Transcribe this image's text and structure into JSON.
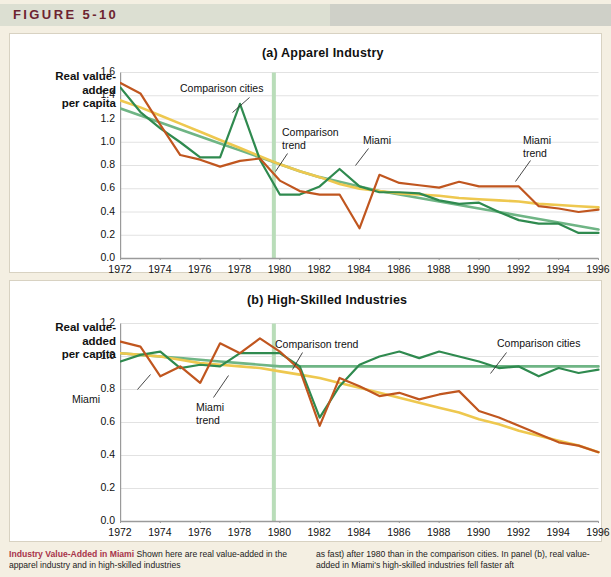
{
  "figure": {
    "label": "FIGURE 5-10"
  },
  "caption": {
    "heading": "Industry Value-Added in Miami",
    "left_text": " Shown here are real value-added in the apparel industry and in high-skilled industries",
    "right_text": "as fast) after 1980 than in the comparison cities. In panel (b), real value-added in Miami's high-skilled industries fell faster aft"
  },
  "colors": {
    "miami": "#c0561f",
    "comparison_cities": "#2f8a4f",
    "miami_trend": "#eec84f",
    "comparison_trend": "#6fb585",
    "marker_line": "#b9ddb9",
    "grid": "#e2e2e2",
    "axis": "#9a9a9a",
    "panel_bg": "#ffffff",
    "page_bg": "#f4efe2",
    "header_bar": "#dcdfd2",
    "header_text": "#6d2430",
    "caption_heading": "#a8344a"
  },
  "chart_data": [
    {
      "type": "line",
      "panel": "a",
      "title": "(a)  Apparel Industry",
      "ylabel": "Real value-\nadded\nper capita",
      "xlabel": "",
      "ylim": [
        0.0,
        1.6
      ],
      "yticks": [
        "0.0",
        "0.2",
        "0.4",
        "0.6",
        "0.8",
        "1.0",
        "1.2",
        "1.4",
        "1.6"
      ],
      "xlim": [
        1972,
        1996
      ],
      "xticks": [
        "1972",
        "1974",
        "1976",
        "1978",
        "1980",
        "1982",
        "1984",
        "1986",
        "1988",
        "1990",
        "1992",
        "1994",
        "1996"
      ],
      "grid": true,
      "legend": "annotations",
      "marker_year": 1979.7,
      "annotations": [
        {
          "text": "Comparison cities",
          "name": "comparison-cities-label"
        },
        {
          "text": "Comparison\ntrend",
          "name": "comparison-trend-label"
        },
        {
          "text": "Miami",
          "name": "miami-label"
        },
        {
          "text": "Miami\ntrend",
          "name": "miami-trend-label"
        }
      ],
      "x": [
        1972,
        1973,
        1974,
        1975,
        1976,
        1977,
        1978,
        1979,
        1980,
        1981,
        1982,
        1983,
        1984,
        1985,
        1986,
        1987,
        1988,
        1989,
        1990,
        1991,
        1992,
        1993,
        1994,
        1995,
        1996
      ],
      "series": [
        {
          "name": "Miami",
          "color": "#c0561f",
          "values": [
            1.51,
            1.42,
            1.15,
            0.89,
            0.85,
            0.79,
            0.84,
            0.86,
            0.67,
            0.58,
            0.55,
            0.55,
            0.26,
            0.72,
            0.65,
            0.63,
            0.61,
            0.66,
            0.62,
            0.62,
            0.62,
            0.45,
            0.43,
            0.4,
            0.42,
            0.36,
            0.35
          ]
        },
        {
          "name": "Comparison cities",
          "color": "#2f8a4f",
          "values": [
            1.47,
            1.26,
            1.12,
            1.0,
            0.87,
            0.87,
            1.33,
            0.85,
            0.55,
            0.55,
            0.62,
            0.77,
            0.62,
            0.57,
            0.57,
            0.56,
            0.5,
            0.47,
            0.48,
            0.4,
            0.33,
            0.3,
            0.3,
            0.22,
            0.22,
            0.3,
            0.33
          ]
        },
        {
          "name": "Miami trend",
          "color": "#eec84f",
          "values": [
            1.36,
            1.3,
            1.23,
            1.16,
            1.09,
            1.02,
            0.95,
            0.88,
            0.81,
            0.75,
            0.7,
            0.64,
            0.6,
            0.58,
            0.56,
            0.55,
            0.54,
            0.52,
            0.51,
            0.5,
            0.49,
            0.47,
            0.46,
            0.45,
            0.44,
            0.43,
            0.42
          ]
        },
        {
          "name": "Comparison trend",
          "color": "#6fb585",
          "values": [
            1.29,
            1.23,
            1.17,
            1.11,
            1.05,
            0.99,
            0.93,
            0.87,
            0.81,
            0.75,
            0.7,
            0.66,
            0.62,
            0.58,
            0.55,
            0.52,
            0.49,
            0.46,
            0.43,
            0.4,
            0.37,
            0.34,
            0.31,
            0.28,
            0.25,
            0.22,
            0.2
          ]
        }
      ]
    },
    {
      "type": "line",
      "panel": "b",
      "title": "(b)  High-Skilled Industries",
      "ylabel": "Real value-\nadded\nper capita",
      "xlabel": "",
      "ylim": [
        0.0,
        1.2
      ],
      "yticks": [
        "0.0",
        "0.2",
        "0.4",
        "0.6",
        "0.8",
        "1.0",
        "1.2"
      ],
      "xlim": [
        1972,
        1996
      ],
      "xticks": [
        "1972",
        "1974",
        "1976",
        "1978",
        "1980",
        "1982",
        "1984",
        "1986",
        "1988",
        "1990",
        "1992",
        "1994",
        "1996"
      ],
      "grid": true,
      "legend": "annotations",
      "marker_year": 1979.7,
      "annotations": [
        {
          "text": "Miami",
          "name": "miami-label"
        },
        {
          "text": "Miami\ntrend",
          "name": "miami-trend-label"
        },
        {
          "text": "Comparison trend",
          "name": "comparison-trend-label"
        },
        {
          "text": "Comparison cities",
          "name": "comparison-cities-label"
        }
      ],
      "x": [
        1972,
        1973,
        1974,
        1975,
        1976,
        1977,
        1978,
        1979,
        1980,
        1981,
        1982,
        1983,
        1984,
        1985,
        1986,
        1987,
        1988,
        1989,
        1990,
        1991,
        1992,
        1993,
        1994,
        1995,
        1996
      ],
      "series": [
        {
          "name": "Miami",
          "color": "#c0561f",
          "values": [
            1.09,
            1.06,
            0.88,
            0.94,
            0.84,
            1.08,
            1.02,
            1.11,
            1.03,
            0.92,
            0.58,
            0.87,
            0.82,
            0.76,
            0.78,
            0.74,
            0.77,
            0.79,
            0.67,
            0.63,
            0.58,
            0.53,
            0.48,
            0.46,
            0.42
          ]
        },
        {
          "name": "Comparison cities",
          "color": "#2f8a4f",
          "values": [
            0.97,
            1.01,
            1.03,
            0.93,
            0.95,
            0.94,
            1.02,
            1.02,
            1.02,
            0.94,
            0.63,
            0.82,
            0.95,
            1.0,
            1.03,
            0.99,
            1.03,
            1.0,
            0.97,
            0.93,
            0.94,
            0.88,
            0.93,
            0.9,
            0.92
          ]
        },
        {
          "name": "Miami trend",
          "color": "#eec84f",
          "values": [
            1.02,
            1.01,
            1.0,
            0.98,
            0.96,
            0.95,
            0.94,
            0.93,
            0.91,
            0.89,
            0.87,
            0.84,
            0.81,
            0.78,
            0.75,
            0.72,
            0.69,
            0.66,
            0.62,
            0.59,
            0.55,
            0.52,
            0.49,
            0.46,
            0.42
          ]
        },
        {
          "name": "Comparison trend",
          "color": "#6fb585",
          "values": [
            1.02,
            1.01,
            1.0,
            0.99,
            0.98,
            0.97,
            0.96,
            0.95,
            0.94,
            0.94,
            0.94,
            0.94,
            0.94,
            0.94,
            0.94,
            0.94,
            0.94,
            0.94,
            0.94,
            0.94,
            0.94,
            0.94,
            0.94,
            0.94,
            0.94
          ]
        }
      ]
    }
  ]
}
